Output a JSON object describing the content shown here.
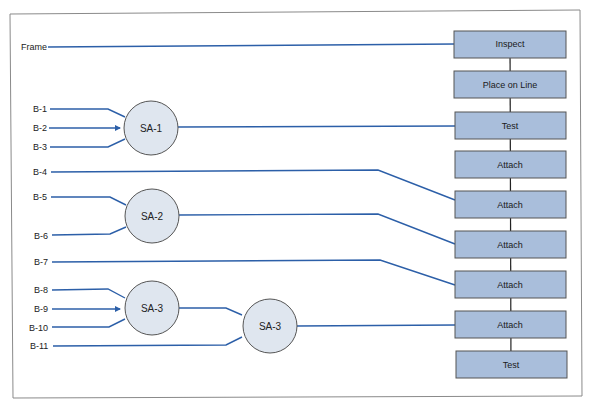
{
  "diagram": {
    "type": "assembly-chart",
    "colors": {
      "line": "#2c5fa8",
      "box_fill": "#a9bedb",
      "box_stroke": "#555555",
      "circle_fill": "#dfe6ef",
      "circle_stroke": "#555555",
      "frame": "#888888"
    },
    "inputs": [
      {
        "id": "frame",
        "label": "Frame"
      },
      {
        "id": "b1",
        "label": "B-1"
      },
      {
        "id": "b2",
        "label": "B-2"
      },
      {
        "id": "b3",
        "label": "B-3"
      },
      {
        "id": "b4",
        "label": "B-4"
      },
      {
        "id": "b5",
        "label": "B-5"
      },
      {
        "id": "b6",
        "label": "B-6"
      },
      {
        "id": "b7",
        "label": "B-7"
      },
      {
        "id": "b8",
        "label": "B-8"
      },
      {
        "id": "b9",
        "label": "B-9"
      },
      {
        "id": "b10",
        "label": "B-10"
      },
      {
        "id": "b11",
        "label": "B-11"
      }
    ],
    "subassemblies": [
      {
        "id": "sa1",
        "label": "SA-1",
        "inputs": [
          "B-1",
          "B-2",
          "B-3"
        ]
      },
      {
        "id": "sa2",
        "label": "SA-2",
        "inputs": [
          "B-5",
          "B-6"
        ]
      },
      {
        "id": "sa3a",
        "label": "SA-3",
        "inputs": [
          "B-8",
          "B-9",
          "B-10"
        ]
      },
      {
        "id": "sa3b",
        "label": "SA-3",
        "inputs": [
          "SA-3",
          "B-11"
        ]
      }
    ],
    "operations": [
      {
        "label": "Inspect",
        "input": "Frame"
      },
      {
        "label": "Place on Line"
      },
      {
        "label": "Test",
        "input": "SA-1"
      },
      {
        "label": "Attach"
      },
      {
        "label": "Attach",
        "input": "B-4"
      },
      {
        "label": "Attach",
        "input": "SA-2"
      },
      {
        "label": "Attach",
        "input": "B-7"
      },
      {
        "label": "Attach",
        "input": "SA-3"
      },
      {
        "label": "Test"
      }
    ]
  }
}
